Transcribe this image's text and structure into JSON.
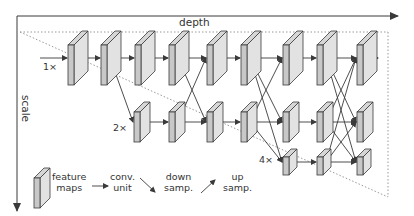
{
  "axes": {
    "depth_label": "depth",
    "scale_label": "scale"
  },
  "rows": [
    {
      "label": "1×",
      "y": 58,
      "boxes": [
        68,
        101,
        135,
        169,
        207,
        241,
        283,
        317,
        357
      ],
      "size": "large"
    },
    {
      "label": "2×",
      "y": 122,
      "boxes": [
        134,
        169,
        207,
        241,
        283,
        317,
        357
      ],
      "size": "medium"
    },
    {
      "label": "4×",
      "y": 162,
      "boxes": [
        283,
        317,
        357
      ],
      "size": "small"
    }
  ],
  "legend": {
    "feature_maps": [
      "feature",
      "maps"
    ],
    "conv_unit": [
      "conv.",
      "unit"
    ],
    "down_samp": [
      "down",
      "samp."
    ],
    "up_samp": [
      "up",
      "samp."
    ]
  },
  "colors": {
    "stroke": "#3a3a3a",
    "face": "#e2e2e2",
    "side": "#c8c8c8",
    "top": "#d6d6d6",
    "dotted": "#9a9a9a"
  }
}
